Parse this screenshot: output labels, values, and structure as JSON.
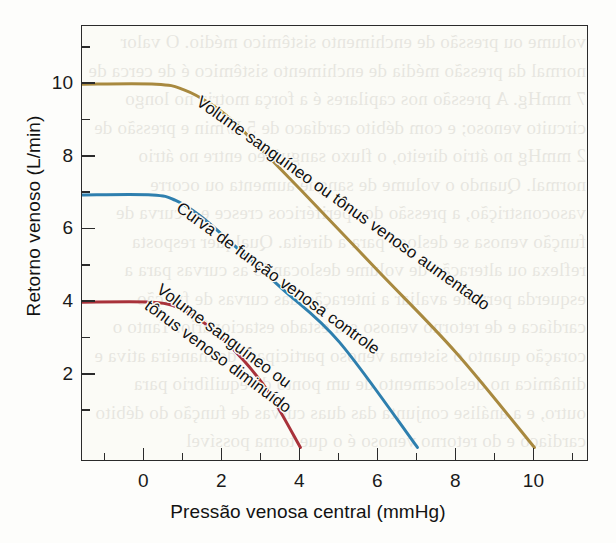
{
  "figure": {
    "background_color": "#fdfdfb",
    "frame_color": "#2b2b2b",
    "bleed_text": "volume ou pressão de enchimento sistêmico médio. O valor normal da pressão média de enchimento sistêmico é de cerca de 7 mmHg. A pressão nos capilares é a força motriz no longo circuito venoso; e com débito cardíaco de 5 L/min e pressão de 2 mmHg no átrio direito, o fluxo sanguíneo entre no átrio normal. Quando o volume de sangue aumenta ou ocorre vasoconstrição, a pressão dos periféricos cresce e a curva de função venosa se desloca para a direita. Qualquer resposta reflexa ou alteração de volume deslocando as curvas para a esquerda permite avaliar a interação das curvas de função cardíaca e de retorno venoso em estado estacionário. Tanto o coração quanto o sistema venoso participam de maneira ativa e dinâmica no deslocamento de um ponto de equilíbrio para outro, e a análise conjunta das duas curvas de função do débito cardíaco e do retorno venoso é o que torna possível compreender a regulação do débito cardíaco normal e suas alterações experimentais e clínicas."
  },
  "chart_data": {
    "type": "line",
    "title": "",
    "xlabel": "Pressão venosa central (mmHg)",
    "ylabel": "Retorno venoso (L/min)",
    "xlim": [
      -1.6,
      11.4
    ],
    "ylim": [
      -0.4,
      11.6
    ],
    "xticks": [
      0,
      2,
      4,
      6,
      8,
      10
    ],
    "xtick_labels": [
      "0",
      "2",
      "4",
      "6",
      "8",
      "10"
    ],
    "x_minor_ticks": [
      -1,
      1,
      3,
      5,
      7,
      9,
      11
    ],
    "yticks": [
      2,
      4,
      6,
      8,
      10
    ],
    "ytick_labels": [
      "2",
      "4",
      "6",
      "8",
      "10"
    ],
    "y_minor_ticks": [
      1,
      3,
      5,
      7,
      9,
      11
    ],
    "grid": false,
    "legend": "inline-labels",
    "series": [
      {
        "name": "Volume sanguíneo ou tônus venoso aumentado",
        "color": "#a8893f",
        "label_text": "Volume sanguíneo ou tônus venoso aumentado",
        "plateau_value": 10,
        "x_intercept": 10,
        "knee_x": 1.2,
        "points": [
          {
            "x": -1.6,
            "y": 10.0
          },
          {
            "x": 0.3,
            "y": 10.0
          },
          {
            "x": 1.0,
            "y": 9.85
          },
          {
            "x": 1.7,
            "y": 9.45
          },
          {
            "x": 2.4,
            "y": 8.85
          },
          {
            "x": 4.0,
            "y": 7.1
          },
          {
            "x": 6.0,
            "y": 4.85
          },
          {
            "x": 8.0,
            "y": 2.6
          },
          {
            "x": 10.0,
            "y": 0.0
          }
        ]
      },
      {
        "name": "Curva de função venosa controle",
        "color": "#2e7fae",
        "label_text": "Curva de função venosa controle",
        "plateau_value": 7,
        "x_intercept": 7,
        "knee_x": 1.0,
        "points": [
          {
            "x": -1.6,
            "y": 6.95
          },
          {
            "x": 0.2,
            "y": 6.95
          },
          {
            "x": 0.8,
            "y": 6.8
          },
          {
            "x": 1.4,
            "y": 6.4
          },
          {
            "x": 2.0,
            "y": 5.85
          },
          {
            "x": 3.5,
            "y": 4.4
          },
          {
            "x": 5.0,
            "y": 2.9
          },
          {
            "x": 7.0,
            "y": 0.0
          }
        ]
      },
      {
        "name": "Volume sanguíneo ou tônus venoso diminuído",
        "color": "#a8323a",
        "label_text": "Volume sanguíneo ou\ntônus venoso diminuído",
        "plateau_value": 4,
        "x_intercept": 4,
        "knee_x": 1.0,
        "points": [
          {
            "x": -1.6,
            "y": 4.0
          },
          {
            "x": 0.2,
            "y": 4.0
          },
          {
            "x": 0.8,
            "y": 3.88
          },
          {
            "x": 1.3,
            "y": 3.6
          },
          {
            "x": 1.8,
            "y": 3.2
          },
          {
            "x": 2.5,
            "y": 2.45
          },
          {
            "x": 3.2,
            "y": 1.5
          },
          {
            "x": 4.0,
            "y": 0.0
          }
        ]
      }
    ]
  }
}
